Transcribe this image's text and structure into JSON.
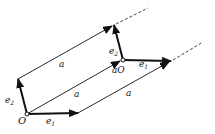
{
  "diagram": {
    "type": "vector-translation",
    "colors": {
      "stroke": "#111111",
      "background": "#ffffff"
    },
    "points": {
      "origin": {
        "label": "O",
        "x": 27,
        "y": 114
      },
      "translated_origin": {
        "label": "aO",
        "x": 123,
        "y": 60
      }
    },
    "labels": {
      "origin": "O",
      "translated_origin": "aO",
      "e1": "e",
      "e1_sub": "1",
      "e2": "e",
      "e2_sub": "2",
      "a": "a"
    },
    "vectors": [
      {
        "name": "e1 at O",
        "from": [
          27,
          114
        ],
        "to": [
          78,
          113
        ]
      },
      {
        "name": "e2 at O",
        "from": [
          27,
          114
        ],
        "to": [
          18,
          79
        ]
      },
      {
        "name": "a from O",
        "from": [
          27,
          114
        ],
        "to": [
          120,
          61
        ]
      },
      {
        "name": "e1 at aO",
        "from": [
          123,
          60
        ],
        "to": [
          171,
          61
        ]
      },
      {
        "name": "e2 at aO",
        "from": [
          123,
          60
        ],
        "to": [
          114,
          25
        ]
      }
    ],
    "translation_lines": [
      {
        "label": "a",
        "from": [
          18,
          79
        ],
        "to": [
          112,
          26
        ]
      },
      {
        "label": "a",
        "from": [
          78,
          113
        ],
        "to": [
          169,
          62
        ]
      }
    ],
    "dashed_extensions": [
      {
        "from": [
          114,
          25
        ],
        "to": [
          148,
          8
        ]
      },
      {
        "from": [
          171,
          61
        ],
        "to": [
          203,
          42
        ]
      }
    ]
  }
}
